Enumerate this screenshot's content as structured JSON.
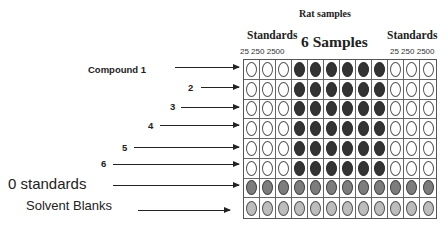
{
  "header": {
    "title": "Rat samples",
    "standards_left": "Standards",
    "standards_right": "Standards",
    "samples": "6 Samples",
    "conc_left": "25 250 2500",
    "conc_right": "25 250 2500"
  },
  "row_labels": [
    {
      "label": "Compound 1",
      "style": "bold",
      "x": 88,
      "y": 64,
      "arrow_x1": 175,
      "arrow_x2": 239,
      "arrow_y": 67
    },
    {
      "label": "2",
      "style": "bold",
      "x": 188,
      "y": 82,
      "arrow_x1": 201,
      "arrow_x2": 239,
      "arrow_y": 87
    },
    {
      "label": "3",
      "style": "bold",
      "x": 170,
      "y": 101,
      "arrow_x1": 181,
      "arrow_x2": 239,
      "arrow_y": 107
    },
    {
      "label": "4",
      "style": "bold",
      "x": 148,
      "y": 120,
      "arrow_x1": 160,
      "arrow_x2": 239,
      "arrow_y": 125
    },
    {
      "label": "5",
      "style": "bold",
      "x": 122,
      "y": 142,
      "arrow_x1": 134,
      "arrow_x2": 239,
      "arrow_y": 147
    },
    {
      "label": "6",
      "style": "bold",
      "x": 101,
      "y": 158,
      "arrow_x1": 113,
      "arrow_x2": 239,
      "arrow_y": 164
    },
    {
      "label": "0 standards",
      "style": "big",
      "x": 8,
      "y": 175,
      "arrow_x1": 113,
      "arrow_x2": 239,
      "arrow_y": 185
    },
    {
      "label": "Solvent Blanks",
      "style": "med",
      "x": 26,
      "y": 198,
      "arrow_x1": 138,
      "arrow_x2": 230,
      "arrow_y": 210
    }
  ],
  "plate": {
    "rows": 8,
    "columns": 12,
    "legend": {
      "empty": "standard well (open)",
      "sample": "rat sample well (dark)",
      "zero": "0 standard well (medium gray)",
      "blank": "solvent blank well (light gray)"
    },
    "layout": [
      [
        "empty",
        "empty",
        "empty",
        "sample",
        "sample",
        "sample",
        "sample",
        "sample",
        "sample",
        "empty",
        "empty",
        "empty"
      ],
      [
        "empty",
        "empty",
        "empty",
        "sample",
        "sample",
        "sample",
        "sample",
        "sample",
        "sample",
        "empty",
        "empty",
        "empty"
      ],
      [
        "empty",
        "empty",
        "empty",
        "sample",
        "sample",
        "sample",
        "sample",
        "sample",
        "sample",
        "empty",
        "empty",
        "empty"
      ],
      [
        "empty",
        "empty",
        "empty",
        "sample",
        "sample",
        "sample",
        "sample",
        "sample",
        "sample",
        "empty",
        "empty",
        "empty"
      ],
      [
        "empty",
        "empty",
        "empty",
        "sample",
        "sample",
        "sample",
        "sample",
        "sample",
        "sample",
        "empty",
        "empty",
        "empty"
      ],
      [
        "empty",
        "empty",
        "empty",
        "sample",
        "sample",
        "sample",
        "sample",
        "sample",
        "sample",
        "empty",
        "empty",
        "empty"
      ],
      [
        "zero",
        "zero",
        "zero",
        "zero",
        "zero",
        "zero",
        "zero",
        "zero",
        "zero",
        "zero",
        "zero",
        "zero"
      ],
      [
        "blank",
        "blank",
        "blank",
        "blank",
        "blank",
        "blank",
        "blank",
        "blank",
        "blank",
        "blank",
        "blank",
        "blank"
      ]
    ],
    "colors": {
      "sample": "#333333",
      "zero": "#7d7d7d",
      "blank": "#bdbdbd",
      "empty": "#ffffff",
      "border": "#555555"
    }
  }
}
